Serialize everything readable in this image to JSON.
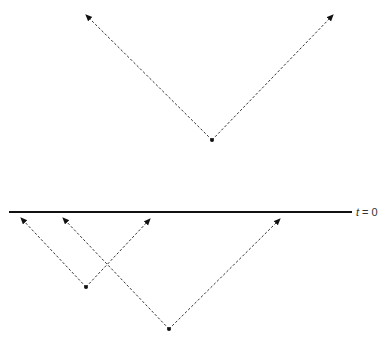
{
  "diagram": {
    "type": "light-cone emission events",
    "time_line_label_var": "t",
    "time_line_label_rest": " = 0",
    "events": [
      {
        "name": "event-top",
        "rays": [
          "up-left",
          "up-right"
        ]
      },
      {
        "name": "event-lower-left",
        "rays": [
          "up-left",
          "up-right"
        ]
      },
      {
        "name": "event-lower-right",
        "rays": [
          "up-left",
          "up-right"
        ]
      }
    ]
  }
}
